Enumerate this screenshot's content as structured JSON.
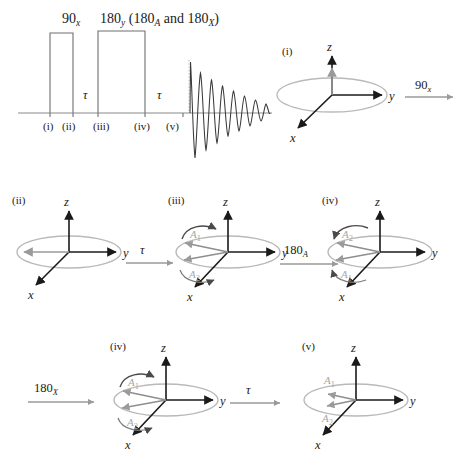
{
  "figure": {
    "type": "nmr-spin-echo-pulse-sequence-vector-diagram",
    "pulse_sequence": {
      "pulse1_label": "90",
      "pulse1_sub": "x",
      "pulse2_label": "180",
      "pulse2_sub": "y",
      "pulse2_paren": "(180",
      "pulse2_paren_sub1": "A",
      "pulse2_paren_mid": "and 180",
      "pulse2_paren_sub2": "X",
      "pulse2_paren_end": ")",
      "delay1": "τ",
      "delay2": "τ",
      "timeline_marks": [
        "(i)",
        "(ii)",
        "(iii)",
        "(iv)",
        "(v)"
      ]
    },
    "transitions": {
      "t1_label": "90",
      "t1_sub": "x",
      "t2_label": "τ",
      "t3_label": "180",
      "t3_sub": "A",
      "t4_label": "180",
      "t4_sub": "X",
      "t5_label": "τ"
    },
    "axes": {
      "x": "x",
      "y": "y",
      "z": "z"
    },
    "vector_labels": {
      "a1": "A",
      "a1_sub": "1",
      "a2": "A",
      "a2_sub": "2"
    },
    "panels": [
      {
        "id": "i",
        "caption": "(i)",
        "state": "magnetization along +z",
        "vectors": [
          "M"
        ]
      },
      {
        "id": "ii",
        "caption": "(ii)",
        "state": "magnetization along -y",
        "vectors": [
          "M"
        ]
      },
      {
        "id": "iii",
        "caption": "(iii)",
        "state": "dephased, A1 above A2",
        "vectors": [
          "A1",
          "A2"
        ]
      },
      {
        "id": "iv_a",
        "caption": "(iv)",
        "state": "after 180A, A2 above A1",
        "vectors": [
          "A2",
          "A1"
        ]
      },
      {
        "id": "iv_x",
        "caption": "(iv)",
        "state": "after 180X, A1 above A2",
        "vectors": [
          "A1",
          "A2"
        ]
      },
      {
        "id": "v",
        "caption": "(v)",
        "state": "refocused echo",
        "vectors": [
          "A1",
          "A2"
        ]
      }
    ]
  },
  "colors": {
    "axis": "#1a1a1a",
    "ellipse": "#b9b9b9",
    "vector": "#9a9a9a",
    "curve": "#4a4a4a",
    "fid": "#3a3a3a",
    "pulse_outline": "#6f6f6f",
    "background": "#ffffff"
  }
}
